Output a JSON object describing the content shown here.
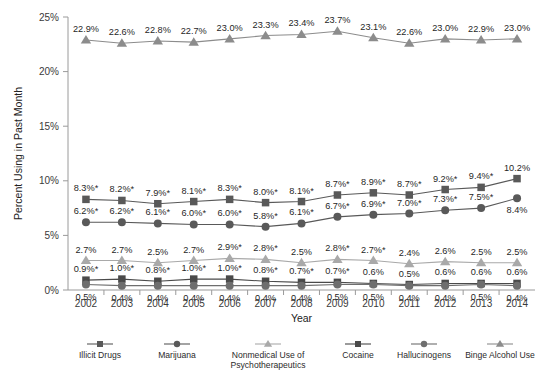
{
  "chart_data": {
    "type": "line",
    "title": "",
    "xlabel": "Year",
    "ylabel": "Percent Using in Past Month",
    "categories": [
      "2002",
      "2003",
      "2004",
      "2005",
      "2006",
      "2007",
      "2008",
      "2009",
      "2010",
      "2011",
      "2012",
      "2013",
      "2014"
    ],
    "x": [
      2002,
      2003,
      2004,
      2005,
      2006,
      2007,
      2008,
      2009,
      2010,
      2011,
      2012,
      2013,
      2014
    ],
    "ylim": [
      0,
      25
    ],
    "ytick_labels": [
      "0%",
      "5%",
      "10%",
      "15%",
      "20%",
      "25%"
    ],
    "ytick_values": [
      0,
      5,
      10,
      15,
      20,
      25
    ],
    "grid": false,
    "legend_position": "bottom",
    "series": [
      {
        "name": "Illicit Drugs",
        "marker": "square",
        "color": "#595959",
        "values": [
          8.3,
          8.2,
          7.9,
          8.1,
          8.3,
          8.0,
          8.1,
          8.7,
          8.9,
          8.7,
          9.2,
          9.4,
          10.2
        ],
        "labels": [
          "8.3%*",
          "8.2%*",
          "7.9%*",
          "8.1%*",
          "8.3%*",
          "8.0%*",
          "8.1%*",
          "8.7%*",
          "8.9%*",
          "8.7%*",
          "9.2%*",
          "9.4%*",
          "10.2%"
        ],
        "label_side": [
          "above",
          "above",
          "above",
          "above",
          "above",
          "above",
          "above",
          "above",
          "above",
          "above",
          "above",
          "above",
          "above"
        ]
      },
      {
        "name": "Marijuana",
        "marker": "circle",
        "color": "#595959",
        "values": [
          6.2,
          6.2,
          6.1,
          6.0,
          6.0,
          5.8,
          6.1,
          6.7,
          6.9,
          7.0,
          7.3,
          7.5,
          8.4
        ],
        "labels": [
          "6.2%*",
          "6.2%*",
          "6.1%*",
          "6.0%*",
          "6.0%*",
          "5.8%*",
          "6.1%*",
          "6.7%*",
          "6.9%*",
          "7.0%*",
          "7.3%*",
          "7.5%*",
          "8.4%"
        ],
        "label_side": [
          "above",
          "above",
          "above",
          "above",
          "above",
          "above",
          "above",
          "above",
          "above",
          "above",
          "above",
          "above",
          "below"
        ]
      },
      {
        "name": "Nonmedical Use of Psychotherapeutics",
        "marker": "triangle",
        "color": "#a9a9a9",
        "values": [
          2.7,
          2.7,
          2.5,
          2.7,
          2.9,
          2.8,
          2.5,
          2.8,
          2.7,
          2.4,
          2.6,
          2.5,
          2.5
        ],
        "labels": [
          "2.7%",
          "2.7%",
          "2.5%",
          "2.7%",
          "2.9%*",
          "2.8%*",
          "2.5%",
          "2.8%*",
          "2.7%*",
          "2.4%",
          "2.6%",
          "2.5%",
          "2.5%"
        ],
        "label_side": [
          "above",
          "above",
          "above",
          "above",
          "above",
          "above",
          "above",
          "above",
          "above",
          "above",
          "above",
          "above",
          "above"
        ]
      },
      {
        "name": "Cocaine",
        "marker": "square",
        "color": "#4a4a4a",
        "values": [
          0.9,
          1.0,
          0.8,
          1.0,
          1.0,
          0.8,
          0.7,
          0.7,
          0.6,
          0.5,
          0.6,
          0.6,
          0.6
        ],
        "labels": [
          "0.9%*",
          "1.0%*",
          "0.8%*",
          "1.0%*",
          "1.0%*",
          "0.8%*",
          "0.7%*",
          "0.7%*",
          "0.6%",
          "0.5%",
          "0.6%",
          "0.6%",
          "0.6%"
        ],
        "label_side": [
          "above",
          "above",
          "above",
          "above",
          "above",
          "above",
          "above",
          "above",
          "above",
          "above",
          "above",
          "above",
          "above"
        ]
      },
      {
        "name": "Hallucinogens",
        "marker": "circle",
        "color": "#6e6e6e",
        "values": [
          0.5,
          0.4,
          0.4,
          0.4,
          0.4,
          0.4,
          0.4,
          0.5,
          0.5,
          0.4,
          0.4,
          0.5,
          0.4
        ],
        "labels": [
          "0.5%",
          "0.4%",
          "0.4%",
          "0.4%",
          "0.4%",
          "0.4%",
          "0.4%",
          "0.5%",
          "0.5%",
          "0.4%",
          "0.4%",
          "0.5%",
          "0.4%"
        ],
        "label_side": [
          "below",
          "below",
          "below",
          "below",
          "below",
          "below",
          "below",
          "below",
          "below",
          "below",
          "below",
          "below",
          "below"
        ]
      },
      {
        "name": "Binge Alcohol Use",
        "marker": "triangle",
        "color": "#8c8c8c",
        "values": [
          22.9,
          22.6,
          22.8,
          22.7,
          23.0,
          23.3,
          23.4,
          23.7,
          23.1,
          22.6,
          23.0,
          22.9,
          23.0
        ],
        "labels": [
          "22.9%",
          "22.6%",
          "22.8%",
          "22.7%",
          "23.0%",
          "23.3%",
          "23.4%",
          "23.7%",
          "23.1%",
          "22.6%",
          "23.0%",
          "22.9%",
          "23.0%"
        ],
        "label_side": [
          "above",
          "above",
          "above",
          "above",
          "above",
          "above",
          "above",
          "above",
          "above",
          "above",
          "above",
          "above",
          "above"
        ]
      }
    ]
  },
  "legend": {
    "entries": [
      {
        "label": "Illicit Drugs",
        "marker": "square",
        "color": "#595959"
      },
      {
        "label": "Marijuana",
        "marker": "circle",
        "color": "#595959"
      },
      {
        "label": "Nonmedical Use of\nPsychotherapeutics",
        "marker": "triangle",
        "color": "#a9a9a9"
      },
      {
        "label": "Cocaine",
        "marker": "square",
        "color": "#4a4a4a"
      },
      {
        "label": "Hallucinogens",
        "marker": "circle",
        "color": "#6e6e6e"
      },
      {
        "label": "Binge Alcohol Use",
        "marker": "triangle",
        "color": "#8c8c8c"
      }
    ]
  },
  "axes": {
    "y_title": "Percent Using in Past Month",
    "x_title": "Year"
  }
}
